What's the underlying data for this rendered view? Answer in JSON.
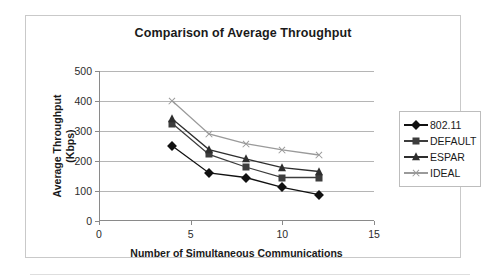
{
  "chart_data": {
    "type": "line",
    "title": "Comparison of Average Throughput",
    "xlabel": "Number of Simultaneous Communications",
    "ylabel": "Average Throughput (Kbps)",
    "ylabel_line1": "Average Throughput",
    "ylabel_line2": "(Kbps)",
    "x": [
      4,
      6,
      8,
      10,
      12
    ],
    "xlim": [
      0,
      15
    ],
    "ylim": [
      0,
      500
    ],
    "xticks": [
      0,
      5,
      10,
      15
    ],
    "yticks": [
      0,
      100,
      200,
      300,
      400,
      500
    ],
    "grid": "horizontal",
    "legend_position": "right",
    "series": [
      {
        "name": "802.11",
        "marker": "diamond",
        "color": "#111111",
        "values": [
          250,
          160,
          145,
          112,
          88
        ]
      },
      {
        "name": "DEFAULT",
        "marker": "square",
        "color": "#3d3d3d",
        "values": [
          325,
          222,
          180,
          145,
          145
        ]
      },
      {
        "name": "ESPAR",
        "marker": "triangle",
        "color": "#2e2e2e",
        "values": [
          340,
          238,
          207,
          178,
          165
        ]
      },
      {
        "name": "IDEAL",
        "marker": "x",
        "color": "#9a9a9a",
        "values": [
          400,
          290,
          258,
          237,
          220
        ]
      }
    ]
  },
  "axis": {
    "ytick_labels": [
      "500",
      "400",
      "300",
      "200",
      "100",
      "0"
    ],
    "xtick_labels": [
      "0",
      "5",
      "10",
      "15"
    ]
  },
  "legend": {
    "items": [
      {
        "label": "802.11"
      },
      {
        "label": "DEFAULT"
      },
      {
        "label": "ESPAR"
      },
      {
        "label": "IDEAL"
      }
    ]
  }
}
